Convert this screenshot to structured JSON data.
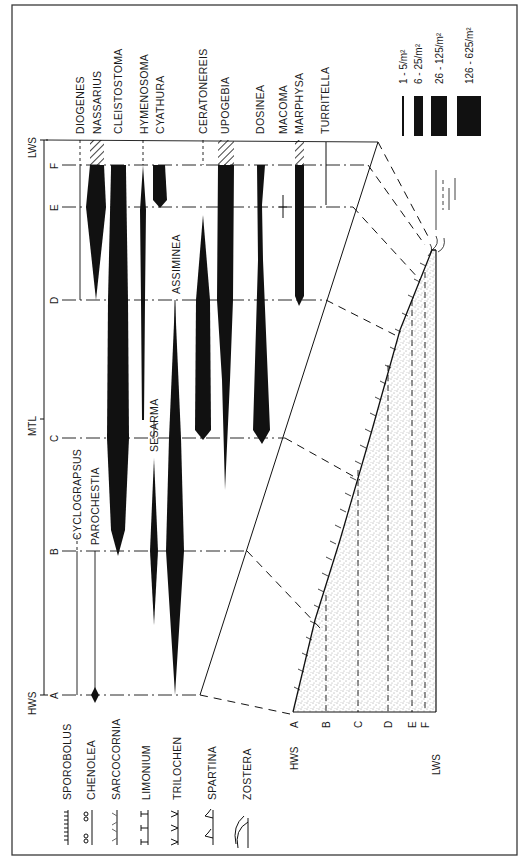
{
  "figure": {
    "orientation": "rotated-90-ccw",
    "frame_color": "#3a3a3a",
    "ink_color": "#111111",
    "paper_color": "#ffffff"
  },
  "tide_levels": {
    "top_label": "LWS",
    "bottom_label": "HWS",
    "mid_label": "MTL",
    "zones": [
      "A",
      "B",
      "C",
      "D",
      "E",
      "F"
    ]
  },
  "upper_species": [
    {
      "name": "DIOGENES",
      "x": 80
    },
    {
      "name": "NASSARIUS",
      "x": 96
    },
    {
      "name": "CLEISTOSTOMA",
      "x": 118
    },
    {
      "name": "HYMENOSOMA",
      "x": 143
    },
    {
      "name": "CYATHURA",
      "x": 159
    },
    {
      "name": "CERATONEREIS",
      "x": 203
    },
    {
      "name": "UPOGEBIA",
      "x": 224
    },
    {
      "name": "DOSINEA",
      "x": 260
    },
    {
      "name": "MACOMA",
      "x": 283
    },
    {
      "name": "MARPHYSA",
      "x": 299
    },
    {
      "name": "TURRITELLA",
      "x": 325
    }
  ],
  "lower_species": [
    {
      "name": "CYCLOGRAPSUS",
      "x": 77
    },
    {
      "name": "PAROCHESTIA",
      "x": 95
    },
    {
      "name": "SESARMA",
      "x": 154
    },
    {
      "name": "ASSIMINEA",
      "x": 176
    }
  ],
  "density_legend": {
    "items": [
      {
        "range": "1 - 5/m²"
      },
      {
        "range": "6 - 25/m²"
      },
      {
        "range": "26 - 125/m²"
      },
      {
        "range": "126 - 625/m²"
      }
    ]
  },
  "vegetation_legend": {
    "items": [
      {
        "name": "SPOROBOLUS"
      },
      {
        "name": "CHENOLEA"
      },
      {
        "name": "SARCOCORNIA"
      },
      {
        "name": "LIMONIUM"
      },
      {
        "name": "TRILOCHEN"
      },
      {
        "name": "SPARTINA"
      },
      {
        "name": "ZOSTERA"
      }
    ]
  },
  "profile": {
    "top_label": "HWS",
    "bottom_label": "LWS",
    "zones": [
      "A",
      "B",
      "C",
      "D",
      "E",
      "F"
    ]
  }
}
